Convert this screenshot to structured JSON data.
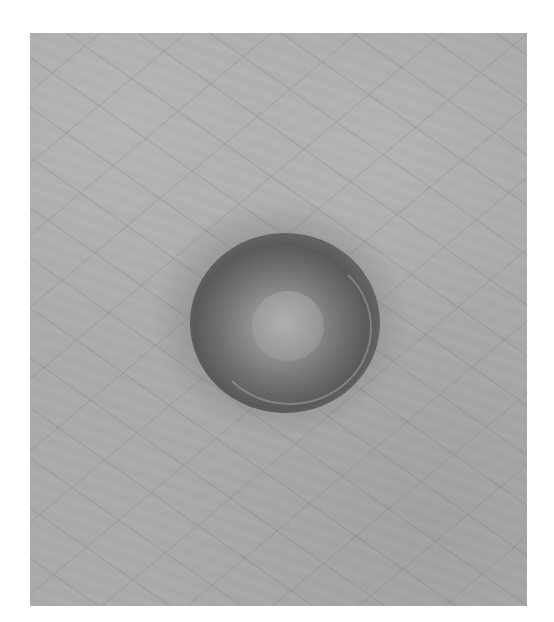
{
  "image": {
    "description": "Grayscale close-up photograph of skin surface with a round dark pigmented lesion featuring a lighter center",
    "colors": {
      "background": "#ffffff",
      "skin": "#a9a9a9",
      "lesion_dark": "#5a5a5a",
      "lesion_center": "#b0b0b0"
    }
  }
}
